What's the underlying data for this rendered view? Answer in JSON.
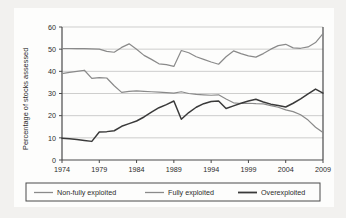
{
  "figure": {
    "background_color": "#f2f1ef",
    "panel_color": "#fdfdfc",
    "frame_color": "#4a4a4a"
  },
  "chart_data": {
    "type": "line",
    "title": "",
    "xlabel": "",
    "ylabel": "Percentage of stocks assessed",
    "xlim": [
      1974,
      2009
    ],
    "ylim": [
      0,
      60
    ],
    "xticks": [
      1974,
      1979,
      1984,
      1989,
      1994,
      1999,
      2004,
      2009
    ],
    "yticks": [
      0,
      10,
      20,
      30,
      40,
      50,
      60
    ],
    "grid": "horizontal",
    "legend_position": "bottom",
    "x": [
      1974,
      1975,
      1976,
      1977,
      1978,
      1979,
      1980,
      1981,
      1982,
      1983,
      1984,
      1985,
      1986,
      1987,
      1988,
      1989,
      1990,
      1991,
      1992,
      1993,
      1994,
      1995,
      1996,
      1997,
      1998,
      1999,
      2000,
      2001,
      2002,
      2003,
      2004,
      2005,
      2006,
      2007,
      2008,
      2009
    ],
    "series": [
      {
        "name": "Non-fully exploited",
        "color": "#8a8a8a",
        "values": [
          39.0,
          39.5,
          40.0,
          40.5,
          36.8,
          37.2,
          37.0,
          33.5,
          30.5,
          31.0,
          31.2,
          31.0,
          30.8,
          30.6,
          30.4,
          30.2,
          30.8,
          30.0,
          29.6,
          29.4,
          29.2,
          29.4,
          27.5,
          25.8,
          25.5,
          25.6,
          25.4,
          25.3,
          24.5,
          23.8,
          22.6,
          21.8,
          20.4,
          18.0,
          14.8,
          12.4
        ]
      },
      {
        "name": "Fully exploited",
        "color": "#8a8a8a",
        "values": [
          50.3,
          50.3,
          50.2,
          50.2,
          50.1,
          50.0,
          49.0,
          48.6,
          50.8,
          52.4,
          50.0,
          47.2,
          45.4,
          43.4,
          43.0,
          42.2,
          49.4,
          48.4,
          46.6,
          45.4,
          44.2,
          43.2,
          46.6,
          49.2,
          48.0,
          47.0,
          46.4,
          48.0,
          50.0,
          51.6,
          52.2,
          50.6,
          50.4,
          51.0,
          53.0,
          57.0
        ]
      },
      {
        "name": "Overexploited",
        "color": "#3a3a3a",
        "values": [
          9.8,
          9.6,
          9.2,
          8.8,
          8.4,
          12.6,
          12.8,
          13.2,
          15.2,
          16.4,
          17.6,
          19.4,
          21.6,
          23.6,
          25.0,
          26.6,
          18.4,
          21.4,
          23.8,
          25.4,
          26.4,
          26.6,
          23.2,
          24.4,
          25.6,
          26.6,
          27.4,
          26.2,
          25.2,
          24.6,
          23.9,
          25.6,
          27.6,
          29.8,
          32.0,
          30.2
        ]
      }
    ]
  },
  "legend": {
    "items": [
      {
        "label": "Non-fully exploited",
        "color": "#8a8a8a"
      },
      {
        "label": "Fully exploited",
        "color": "#8a8a8a"
      },
      {
        "label": "Overexploited",
        "color": "#3a3a3a"
      }
    ]
  }
}
